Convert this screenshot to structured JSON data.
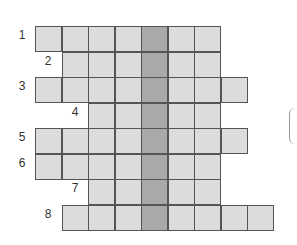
{
  "puzzle": {
    "type": "crossword-grid",
    "key_column": 4,
    "colors": {
      "cell": "#dcdcdc",
      "key_cell": "#a9a9a9",
      "border": "#555555"
    },
    "rows": [
      {
        "label": "1",
        "start": 0,
        "end": 6,
        "label_x": 22,
        "label_y": 35
      },
      {
        "label": "2",
        "start": 1,
        "end": 6,
        "label_x": 48,
        "label_y": 61
      },
      {
        "label": "3",
        "start": 0,
        "end": 7,
        "label_x": 22,
        "label_y": 86
      },
      {
        "label": "4",
        "start": 2,
        "end": 6,
        "label_x": 75,
        "label_y": 112
      },
      {
        "label": "5",
        "start": 0,
        "end": 7,
        "label_x": 22,
        "label_y": 137
      },
      {
        "label": "6",
        "start": 0,
        "end": 6,
        "label_x": 22,
        "label_y": 163
      },
      {
        "label": "7",
        "start": 2,
        "end": 6,
        "label_x": 75,
        "label_y": 188
      },
      {
        "label": "8",
        "start": 1,
        "end": 8,
        "label_x": 48,
        "label_y": 214
      }
    ]
  }
}
